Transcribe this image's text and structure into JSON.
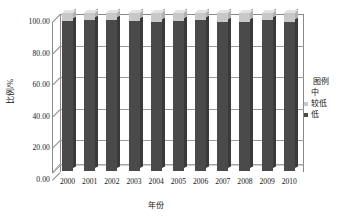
{
  "chart_data": {
    "type": "bar",
    "subtype": "stacked-column-3d",
    "title": "",
    "xlabel": "年份",
    "ylabel": "比例/%",
    "categories": [
      "2000",
      "2001",
      "2002",
      "2003",
      "2004",
      "2005",
      "2006",
      "2007",
      "2008",
      "2009",
      "2010"
    ],
    "series": [
      {
        "name": "低",
        "color": "#4a4a4a",
        "values": [
          95.0,
          95.6,
          95.4,
          95.2,
          94.4,
          94.8,
          95.4,
          94.6,
          94.6,
          95.4,
          94.2
        ]
      },
      {
        "name": "较低",
        "color": "#c8c8c8",
        "values": [
          5.0,
          4.4,
          4.6,
          4.8,
          5.6,
          5.2,
          4.6,
          5.4,
          5.4,
          4.6,
          5.8
        ]
      },
      {
        "name": "中",
        "color": "#ffffff",
        "values": [
          0.0,
          0.0,
          0.0,
          0.0,
          0.0,
          0.0,
          0.0,
          0.0,
          0.0,
          0.0,
          0.0
        ]
      }
    ],
    "ylim": [
      0,
      100
    ],
    "yticks": [
      "0.00",
      "20.00",
      "40.00",
      "60.00",
      "80.00",
      "100.00"
    ],
    "ytick_values": [
      0,
      20,
      40,
      60,
      80,
      100
    ],
    "grid": true,
    "legend_position": "right"
  },
  "legend": {
    "title": "图例",
    "items": [
      {
        "label": "中",
        "marker": "none",
        "color": "#ffffff"
      },
      {
        "label": "较低",
        "marker": "square",
        "color": "#c8c8c8"
      },
      {
        "label": "低",
        "marker": "square",
        "color": "#4a4a4a"
      }
    ]
  },
  "colors": {
    "axis": "#8a8a8a",
    "grid": "#9a9a9a",
    "text": "#161616",
    "series_low": "#4a4a4a",
    "series_low_side": "#3a3a3a",
    "series_lower_mid": "#c8c8c8",
    "series_lower_mid_side": "#b0b0b0",
    "background": "#ffffff"
  }
}
